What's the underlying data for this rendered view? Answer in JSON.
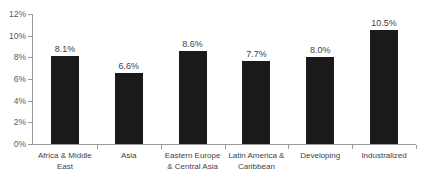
{
  "chart_data": {
    "type": "bar",
    "title": "",
    "xlabel": "",
    "ylabel": "",
    "ylim": [
      0,
      12
    ],
    "ytick_labels": [
      "0%",
      "2%",
      "4%",
      "6%",
      "8%",
      "10%",
      "12%"
    ],
    "ytick_values": [
      0,
      2,
      4,
      6,
      8,
      10,
      12
    ],
    "grid": false,
    "legend": "none",
    "categories": [
      "Africa & Middle\nEast",
      "Asia",
      "Eastern Europe\n& Central Asia",
      "Latin America &\nCaribbean",
      "Developing",
      "Industralized"
    ],
    "values": [
      8.1,
      6.6,
      8.6,
      7.7,
      8.0,
      10.5
    ],
    "value_labels": [
      "8.1%",
      "6.6%",
      "8.6%",
      "7.7%",
      "8.0%",
      "10.5%"
    ],
    "bar_color": "#1a1a1a",
    "axis_color": "#9a9a9a",
    "text_color": "#3f3f3f",
    "tick_text_color": "#595959"
  },
  "title_remnant": {
    "text": "."
  }
}
